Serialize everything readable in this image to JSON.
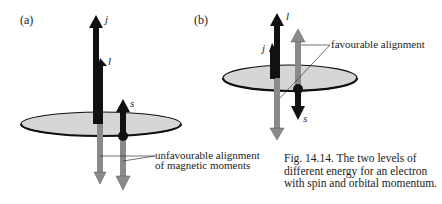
{
  "figure": {
    "panel_a": {
      "label": "(a)",
      "vectors": {
        "j": "j",
        "l": "l",
        "s": "s"
      },
      "annotation_line1": "unfavourable alignment",
      "annotation_line2": "of magnetic moments"
    },
    "panel_b": {
      "label": "(b)",
      "vectors": {
        "l": "l",
        "j": "j",
        "s": "s"
      },
      "annotation": "favourable alignment"
    },
    "caption": "Fig. 14.14.  The two levels of different energy for an electron with spin and orbital momentum.",
    "colors": {
      "black_arrow": "#111111",
      "grey_arrow": "#8a8a8a",
      "disc_fill": "#d6d6d6",
      "disc_edge": "#111111"
    }
  }
}
